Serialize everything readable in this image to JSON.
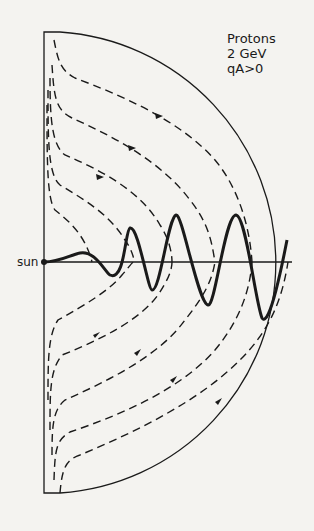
{
  "figure": {
    "legend": {
      "particle": "Protons",
      "energy": "2 GeV",
      "polarity": "qA>0"
    },
    "sun_label": "sun",
    "colors": {
      "line": "#1a1a1a",
      "background": "#f4f3f0"
    }
  }
}
